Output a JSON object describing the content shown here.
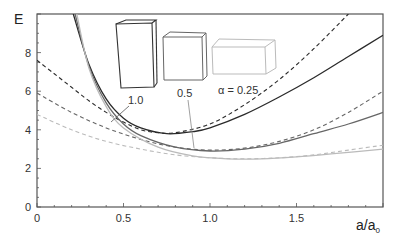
{
  "chart_data": {
    "type": "line",
    "title": "",
    "xlabel": "a/a",
    "xlabel_subscript": "0",
    "ylabel": "E",
    "xlim": [
      0,
      2.0
    ],
    "ylim": [
      0,
      10
    ],
    "x_ticks": [
      "0",
      "0.5",
      "1.0",
      "1.5"
    ],
    "y_ticks": [
      "0",
      "2",
      "4",
      "6",
      "8"
    ],
    "grid": false,
    "legend": "inline annotations with box shape icons",
    "annotations": [
      "1.0",
      "0.5",
      "α = 0.25"
    ],
    "series": [
      {
        "name": "α = 1.0 (solid)",
        "color": "#2a2a2a",
        "dash": "none",
        "x": [
          0.21,
          0.3,
          0.4,
          0.5,
          0.6,
          0.75,
          0.9,
          1.0,
          1.2,
          1.4,
          1.6,
          1.8,
          2.0
        ],
        "y": [
          10,
          7.4,
          5.6,
          4.6,
          4.1,
          3.8,
          3.9,
          4.1,
          4.8,
          5.7,
          6.7,
          7.8,
          8.9
        ]
      },
      {
        "name": "α = 1.0 (dashed)",
        "color": "#2a2a2a",
        "dash": "4,3",
        "x": [
          0,
          0.1,
          0.2,
          0.3,
          0.4,
          0.5,
          0.6,
          0.7,
          0.8,
          1.0,
          1.2,
          1.4,
          1.6,
          1.8
        ],
        "y": [
          7.6,
          6.9,
          6.2,
          5.5,
          4.9,
          4.4,
          4.0,
          3.85,
          3.85,
          4.3,
          5.3,
          6.6,
          8.2,
          10
        ]
      },
      {
        "name": "α = 0.5 (solid)",
        "color": "#666666",
        "dash": "none",
        "x": [
          0.22,
          0.3,
          0.4,
          0.5,
          0.6,
          0.8,
          1.0,
          1.2,
          1.4,
          1.6,
          1.8,
          2.0
        ],
        "y": [
          10,
          7.3,
          5.4,
          4.3,
          3.7,
          3.1,
          2.9,
          3.0,
          3.3,
          3.8,
          4.3,
          4.9
        ]
      },
      {
        "name": "α = 0.5 (dashed)",
        "color": "#666666",
        "dash": "4,3",
        "x": [
          0,
          0.2,
          0.4,
          0.6,
          0.8,
          1.0,
          1.2,
          1.4,
          1.6,
          1.8,
          2.0
        ],
        "y": [
          5.9,
          4.9,
          4.1,
          3.5,
          3.1,
          2.95,
          3.05,
          3.4,
          4.0,
          4.9,
          6.0
        ]
      },
      {
        "name": "α = 0.25 (solid)",
        "color": "#bbbbbb",
        "dash": "none",
        "x": [
          0.23,
          0.3,
          0.4,
          0.5,
          0.7,
          0.9,
          1.1,
          1.3,
          1.5,
          1.7,
          2.0
        ],
        "y": [
          10,
          7.2,
          5.2,
          4.1,
          3.1,
          2.65,
          2.5,
          2.5,
          2.6,
          2.75,
          3.0
        ]
      },
      {
        "name": "α = 0.25 (dashed)",
        "color": "#bbbbbb",
        "dash": "4,3",
        "x": [
          0,
          0.2,
          0.4,
          0.6,
          0.8,
          1.0,
          1.2,
          1.4,
          1.6,
          1.8,
          2.0
        ],
        "y": [
          4.8,
          4.0,
          3.4,
          3.0,
          2.7,
          2.55,
          2.5,
          2.55,
          2.7,
          2.95,
          3.2
        ]
      }
    ]
  },
  "labels": {
    "y_axis": "E",
    "x_axis_main": "a/a",
    "x_axis_sub": "0",
    "annot_1": "1.0",
    "annot_05": "0.5",
    "annot_025": "α = 0.25"
  }
}
